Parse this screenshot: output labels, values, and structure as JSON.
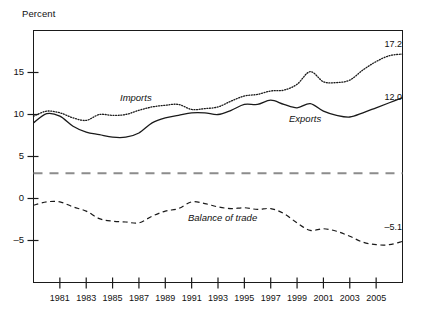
{
  "chart_data": {
    "type": "line",
    "title": "",
    "xlabel": "",
    "ylabel": "Percent",
    "ylim": [
      -10,
      20
    ],
    "xlim": [
      1979,
      2007
    ],
    "grid": false,
    "legend_position": "inline-annotations",
    "ytick_labels": [
      "15",
      "10",
      "5",
      "0",
      "–5"
    ],
    "ytick_values": [
      15,
      10,
      5,
      0,
      -5
    ],
    "xtick_labels": [
      "1981",
      "1983",
      "1985",
      "1987",
      "1989",
      "1991",
      "1993",
      "1995",
      "1997",
      "1999",
      "2001",
      "2003",
      "2005"
    ],
    "xtick_values": [
      1981,
      1983,
      1985,
      1987,
      1989,
      1991,
      1993,
      1995,
      1997,
      1999,
      2001,
      2003,
      2005
    ],
    "x": [
      1979,
      1980,
      1981,
      1982,
      1983,
      1984,
      1985,
      1986,
      1987,
      1988,
      1989,
      1990,
      1991,
      1992,
      1993,
      1994,
      1995,
      1996,
      1997,
      1998,
      1999,
      2000,
      2001,
      2002,
      2003,
      2004,
      2005,
      2006,
      2007
    ],
    "series": [
      {
        "name": "Imports",
        "style": "dotted",
        "color": "#1a1a1a",
        "end_label": "17.2",
        "end_value": 17.2,
        "values": [
          9.8,
          10.4,
          10.2,
          9.6,
          9.3,
          10.0,
          9.9,
          10.0,
          10.5,
          10.9,
          11.1,
          11.2,
          10.6,
          10.7,
          10.9,
          11.6,
          12.2,
          12.4,
          12.8,
          12.9,
          13.6,
          15.1,
          13.9,
          13.8,
          14.1,
          15.3,
          16.3,
          17.0,
          17.2
        ]
      },
      {
        "name": "Exports",
        "style": "solid",
        "color": "#1a1a1a",
        "end_label": "12.0",
        "end_value": 12.0,
        "values": [
          9.0,
          10.1,
          9.8,
          8.6,
          7.9,
          7.6,
          7.3,
          7.3,
          7.8,
          9.0,
          9.6,
          9.9,
          10.2,
          10.2,
          10.0,
          10.5,
          11.2,
          11.2,
          11.7,
          11.2,
          10.8,
          11.3,
          10.4,
          9.9,
          9.7,
          10.2,
          10.8,
          11.4,
          12.0
        ]
      },
      {
        "name": "Balance of trade",
        "style": "dashed",
        "color": "#1a1a1a",
        "end_label": "–5.1",
        "end_value": -5.1,
        "values": [
          -0.8,
          -0.4,
          -0.4,
          -1.0,
          -1.5,
          -2.4,
          -2.7,
          -2.8,
          -2.9,
          -2.1,
          -1.5,
          -1.2,
          -0.4,
          -0.6,
          -1.0,
          -1.2,
          -1.1,
          -1.3,
          -1.2,
          -1.8,
          -2.9,
          -3.8,
          -3.6,
          -3.9,
          -4.5,
          -5.2,
          -5.5,
          -5.5,
          -5.1
        ]
      }
    ],
    "reference_line": {
      "name": "reference-line",
      "value": 3.0,
      "style": "dashed",
      "color": "#8c8c8c"
    }
  }
}
